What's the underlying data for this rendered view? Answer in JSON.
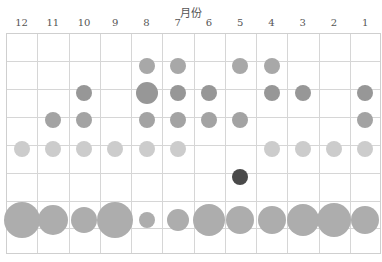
{
  "chart_data": {
    "type": "scatter",
    "subtype": "bubble",
    "orientation_note": "image rendered rotated 180 degrees",
    "xlabel": "月份",
    "categories": [
      "12",
      "11",
      "10",
      "9",
      "8",
      "7",
      "6",
      "5",
      "4",
      "3",
      "2",
      "1"
    ],
    "rows": [
      {
        "y": 66,
        "color": "#a8a8a8",
        "points": [
          {
            "month": "8",
            "r": 8
          },
          {
            "month": "7",
            "r": 8
          },
          {
            "month": "5",
            "r": 8
          },
          {
            "month": "4",
            "r": 8
          }
        ]
      },
      {
        "y": 93,
        "color": "#979797",
        "points": [
          {
            "month": "10",
            "r": 8
          },
          {
            "month": "8",
            "r": 11
          },
          {
            "month": "7",
            "r": 8
          },
          {
            "month": "6",
            "r": 8
          },
          {
            "month": "4",
            "r": 8
          },
          {
            "month": "3",
            "r": 8
          },
          {
            "month": "1",
            "r": 8
          }
        ]
      },
      {
        "y": 120,
        "color": "#a3a3a3",
        "points": [
          {
            "month": "11",
            "r": 8
          },
          {
            "month": "10",
            "r": 8
          },
          {
            "month": "8",
            "r": 8
          },
          {
            "month": "7",
            "r": 8
          },
          {
            "month": "6",
            "r": 8
          },
          {
            "month": "5",
            "r": 8
          },
          {
            "month": "1",
            "r": 8
          }
        ]
      },
      {
        "y": 149,
        "color": "#cccccc",
        "points": [
          {
            "month": "12",
            "r": 8
          },
          {
            "month": "11",
            "r": 8
          },
          {
            "month": "10",
            "r": 8
          },
          {
            "month": "9",
            "r": 8
          },
          {
            "month": "8",
            "r": 8
          },
          {
            "month": "7",
            "r": 8
          },
          {
            "month": "4",
            "r": 8
          },
          {
            "month": "3",
            "r": 8
          },
          {
            "month": "2",
            "r": 8
          },
          {
            "month": "1",
            "r": 8
          }
        ]
      },
      {
        "y": 177,
        "color": "#4a4a4a",
        "points": [
          {
            "month": "5",
            "r": 8
          }
        ]
      },
      {
        "y": 220,
        "color": "#adadad",
        "points": [
          {
            "month": "12",
            "r": 18
          },
          {
            "month": "11",
            "r": 15
          },
          {
            "month": "10",
            "r": 13
          },
          {
            "month": "9",
            "r": 18
          },
          {
            "month": "8",
            "r": 8
          },
          {
            "month": "7",
            "r": 11
          },
          {
            "month": "6",
            "r": 16
          },
          {
            "month": "5",
            "r": 14
          },
          {
            "month": "4",
            "r": 14
          },
          {
            "month": "3",
            "r": 16
          },
          {
            "month": "2",
            "r": 17
          },
          {
            "month": "1",
            "r": 14
          }
        ]
      }
    ],
    "grid": true
  }
}
